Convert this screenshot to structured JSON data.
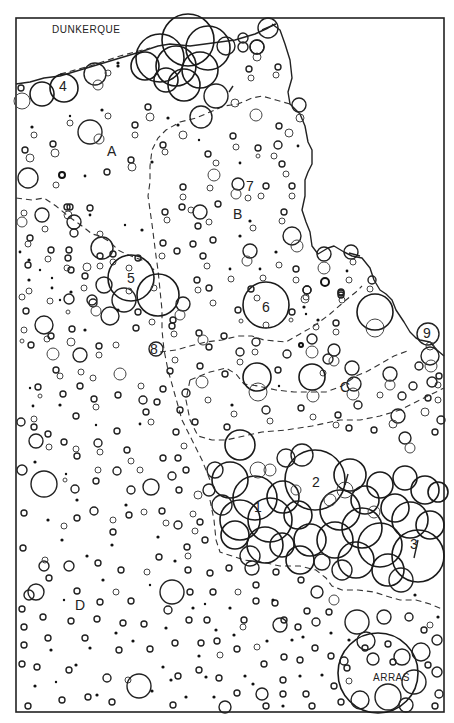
{
  "map": {
    "type": "proportional-symbol map (circles)",
    "frame": {
      "x": 16,
      "y": 18,
      "width": 428,
      "height": 694
    },
    "cities": [
      {
        "id": "dunkerque",
        "label": "DUNKERQUE",
        "x": 52,
        "y": 33
      },
      {
        "id": "arras",
        "label": "ARRAS",
        "x": 373,
        "y": 681
      }
    ],
    "zones": [
      {
        "id": "A",
        "label": "A",
        "x": 107,
        "y": 156
      },
      {
        "id": "B",
        "label": "B",
        "x": 233,
        "y": 219
      },
      {
        "id": "C",
        "label": "C",
        "x": 340,
        "y": 392
      },
      {
        "id": "D",
        "label": "D",
        "x": 75,
        "y": 610
      }
    ],
    "numbered_clusters": [
      {
        "id": "1",
        "label": "1",
        "x": 258,
        "y": 509
      },
      {
        "id": "2",
        "label": "2",
        "x": 316,
        "y": 484
      },
      {
        "id": "3",
        "label": "3",
        "x": 414,
        "y": 546
      },
      {
        "id": "4",
        "label": "4",
        "x": 63,
        "y": 88
      },
      {
        "id": "5",
        "label": "5",
        "x": 131,
        "y": 280
      },
      {
        "id": "6",
        "label": "6",
        "x": 266,
        "y": 309
      },
      {
        "id": "7",
        "label": "7",
        "x": 250,
        "y": 188
      },
      {
        "id": "8",
        "label": "8",
        "x": 154,
        "y": 351
      },
      {
        "id": "9",
        "label": "9",
        "x": 427,
        "y": 335
      }
    ]
  }
}
